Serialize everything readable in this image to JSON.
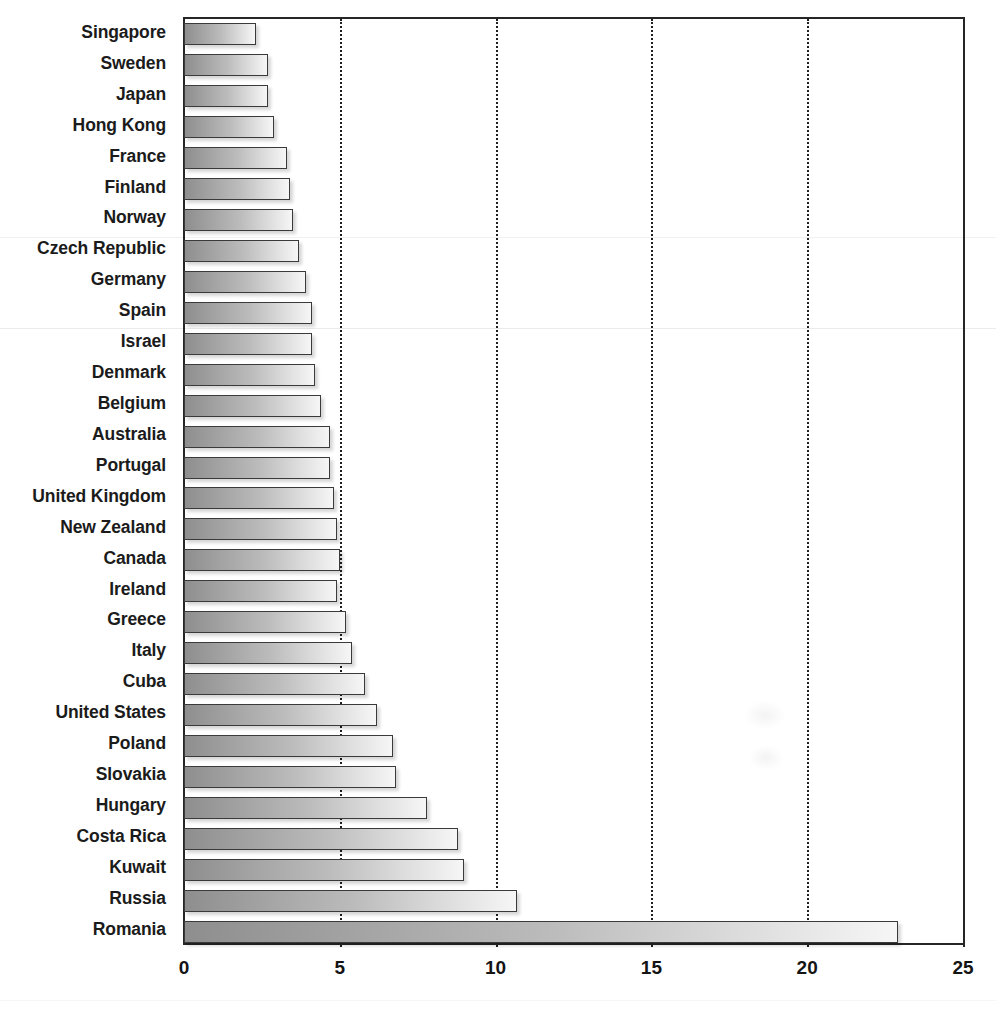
{
  "chart_data": {
    "type": "bar",
    "orientation": "horizontal",
    "title": "",
    "subtitle": "",
    "xlabel": "",
    "ylabel": "",
    "xlim": [
      0,
      25
    ],
    "ylim": null,
    "grid": true,
    "grid_axis": "x",
    "gridline_style": "dotted",
    "legend": false,
    "legend_position": "none",
    "xticks": [
      "0",
      "5",
      "10",
      "15",
      "20",
      "25"
    ],
    "xtick_values": [
      0,
      5,
      10,
      15,
      20,
      25
    ],
    "bar_fill": "gray-gradient-left-to-right",
    "bar_edge_color": "#3a3a3a",
    "categories": [
      "Singapore",
      "Sweden",
      "Japan",
      "Hong Kong",
      "France",
      "Finland",
      "Norway",
      "Czech Republic",
      "Germany",
      "Spain",
      "Israel",
      "Denmark",
      "Belgium",
      "Australia",
      "Portugal",
      "United Kingdom",
      "New Zealand",
      "Canada",
      "Ireland",
      "Greece",
      "Italy",
      "Cuba",
      "United States",
      "Poland",
      "Slovakia",
      "Hungary",
      "Costa Rica",
      "Kuwait",
      "Russia",
      "Romania"
    ],
    "values": [
      2.3,
      2.7,
      2.7,
      2.9,
      3.3,
      3.4,
      3.5,
      3.7,
      3.9,
      4.1,
      4.1,
      4.2,
      4.4,
      4.7,
      4.7,
      4.8,
      4.9,
      5.0,
      4.9,
      5.2,
      5.4,
      5.8,
      6.2,
      6.7,
      6.8,
      7.8,
      8.8,
      9.0,
      10.7,
      22.9
    ]
  },
  "colors": {
    "axis": "#262626",
    "gridline": "#1f1f1f",
    "bar_light": "#f6f6f6",
    "bar_dark": "#8e8e8e",
    "bar_edge": "#3a3a3a",
    "text": "#1b1b1b",
    "background": "#ffffff"
  }
}
